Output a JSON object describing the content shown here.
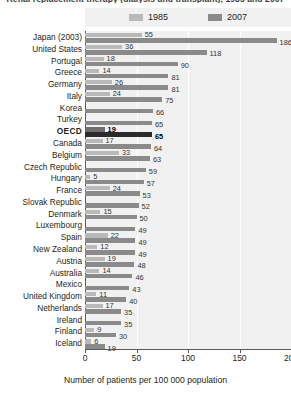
{
  "title": "Renal replacement therapy (dialysis and transplant), 1985 and 2007",
  "legend": {
    "entries": [
      {
        "label": "1985",
        "color": "#b9b9b9"
      },
      {
        "label": "2007",
        "color": "#8a8a8a"
      }
    ]
  },
  "axis": {
    "x_title": "Number of patients per 100 000 population",
    "x_ticks": [
      "0",
      "50",
      "100",
      "150",
      "200"
    ]
  },
  "chart_data": {
    "type": "bar",
    "orientation": "horizontal",
    "title": "Renal replacement therapy (dialysis and transplant), 1985 and 2007",
    "xlabel": "Number of patients per 100 000 population",
    "ylabel": "",
    "xlim": [
      0,
      200
    ],
    "grid": true,
    "legend_position": "top",
    "categories": [
      "Japan (2003)",
      "United States",
      "Portugal",
      "Greece",
      "Germany",
      "Italy",
      "Korea",
      "Turkey",
      "OECD",
      "Canada",
      "Belgium",
      "Czech Republic",
      "Hungary",
      "France",
      "Slovak Republic",
      "Denmark",
      "Luxembourg",
      "Spain",
      "New Zealand",
      "Austria",
      "Australia",
      "Mexico",
      "United Kingdom",
      "Netherlands",
      "Ireland",
      "Finland",
      "Iceland"
    ],
    "highlight_category": "OECD",
    "series": [
      {
        "name": "1985",
        "color": "#b9b9b9",
        "values": [
          55,
          36,
          18,
          14,
          26,
          24,
          null,
          null,
          19,
          17,
          33,
          null,
          5,
          24,
          null,
          15,
          null,
          22,
          12,
          19,
          14,
          null,
          11,
          17,
          null,
          9,
          6
        ]
      },
      {
        "name": "2007",
        "color": "#8a8a8a",
        "values": [
          186,
          118,
          90,
          81,
          81,
          75,
          66,
          65,
          65,
          64,
          63,
          59,
          57,
          53,
          52,
          50,
          49,
          49,
          49,
          48,
          46,
          43,
          40,
          35,
          35,
          30,
          19
        ]
      }
    ]
  }
}
